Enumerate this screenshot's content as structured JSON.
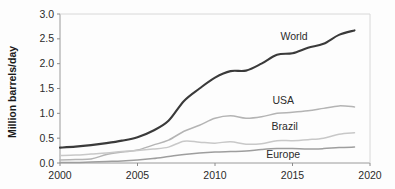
{
  "chart_data": {
    "type": "line",
    "title": "",
    "xlabel": "",
    "ylabel": "Million barrels/day",
    "xlim": [
      2000,
      2020
    ],
    "ylim": [
      0.0,
      3.0
    ],
    "xticks": [
      "2000",
      "2005",
      "2010",
      "2015",
      "2020"
    ],
    "yticks": [
      "0.0",
      "0.5",
      "1.0",
      "1.5",
      "2.0",
      "2.5",
      "3.0"
    ],
    "grid": false,
    "legend_position": "inline-right",
    "x": [
      2000,
      2001,
      2002,
      2003,
      2004,
      2005,
      2006,
      2007,
      2008,
      2009,
      2010,
      2011,
      2012,
      2013,
      2014,
      2015,
      2016,
      2017,
      2018,
      2019
    ],
    "series": [
      {
        "name": "World",
        "color": "#3a3a3a",
        "width": 2.1,
        "label_x": 2015.1,
        "label_y": 2.54,
        "values": [
          0.31,
          0.33,
          0.36,
          0.4,
          0.45,
          0.52,
          0.65,
          0.85,
          1.25,
          1.5,
          1.72,
          1.85,
          1.86,
          2.0,
          2.18,
          2.21,
          2.32,
          2.4,
          2.58,
          2.67
        ]
      },
      {
        "name": "USA",
        "color": "#b4b4b4",
        "width": 1.5,
        "label_x": 2014.4,
        "label_y": 1.27,
        "values": [
          0.06,
          0.07,
          0.08,
          0.17,
          0.22,
          0.26,
          0.36,
          0.46,
          0.64,
          0.76,
          0.9,
          0.95,
          0.9,
          0.93,
          1.0,
          1.02,
          1.05,
          1.1,
          1.15,
          1.13
        ]
      },
      {
        "name": "Brazil",
        "color": "#c8c8c8",
        "width": 1.5,
        "label_x": 2014.5,
        "label_y": 0.74,
        "values": [
          0.15,
          0.16,
          0.18,
          0.2,
          0.23,
          0.25,
          0.28,
          0.32,
          0.44,
          0.42,
          0.4,
          0.43,
          0.38,
          0.39,
          0.45,
          0.45,
          0.47,
          0.5,
          0.58,
          0.61
        ]
      },
      {
        "name": "Europe",
        "color": "#9e9e9e",
        "width": 1.5,
        "label_x": 2014.4,
        "label_y": 0.17,
        "values": [
          0.01,
          0.01,
          0.02,
          0.03,
          0.04,
          0.06,
          0.09,
          0.13,
          0.17,
          0.2,
          0.22,
          0.23,
          0.24,
          0.27,
          0.29,
          0.29,
          0.28,
          0.29,
          0.31,
          0.32
        ]
      }
    ]
  }
}
